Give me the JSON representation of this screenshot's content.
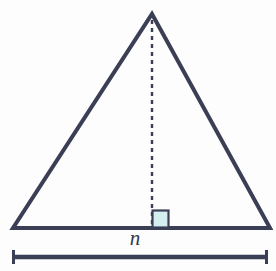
{
  "figure": {
    "kind": "isosceles-triangle-with-altitude",
    "background_color": "#fdfdfd",
    "stroke_color": "#3a3f55",
    "right_angle_fill": "#d5eef0",
    "right_angle_stroke": "#3a3f55",
    "label_color": "#32384d",
    "base_label": "n",
    "altitude_style": "dashed",
    "triangle": {
      "apex": [
        152,
        14
      ],
      "base_left": [
        13,
        228
      ],
      "base_right": [
        270,
        228
      ],
      "stroke_width": 4
    },
    "altitude": {
      "from": [
        152,
        20
      ],
      "to": [
        152,
        228
      ],
      "dash": "4 4",
      "stroke_width": 2.4
    },
    "right_angle_marker": {
      "x": 152,
      "y": 210,
      "width": 16,
      "height": 17
    },
    "measure_bar": {
      "y": 257,
      "x_start": 12,
      "x_end": 268,
      "stroke_width": 4.5,
      "cap_half_height": 7,
      "cap_width": 3
    },
    "label_position": {
      "x": 149,
      "y": 238
    }
  }
}
